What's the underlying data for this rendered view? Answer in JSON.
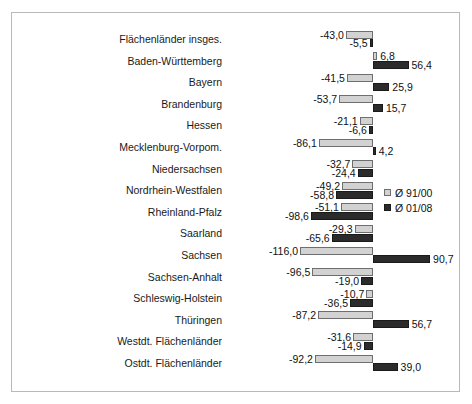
{
  "chart_data": {
    "type": "bar",
    "orientation": "horizontal",
    "title": "",
    "subtitle": "",
    "xlabel": "",
    "ylabel": "",
    "grid": false,
    "legend_position": "middle-right",
    "xlim": [
      -130,
      100
    ],
    "zero_axis": true,
    "categories": [
      "Flächenländer insges.",
      "Baden-Württemberg",
      "Bayern",
      "Brandenburg",
      "Hessen",
      "Mecklenburg-Vorpom.",
      "Niedersachsen",
      "Nordrhein-Westfalen",
      "Rheinland-Pfalz",
      "Saarland",
      "Sachsen",
      "Sachsen-Anhalt",
      "Schleswig-Holstein",
      "Thüringen",
      "Westdt. Flächenländer",
      "Ostdt. Flächenländer"
    ],
    "series": [
      {
        "name": "Ø 91/00",
        "color": "#d2d2d2",
        "values": [
          -43.0,
          6.8,
          -41.5,
          -53.7,
          -21.1,
          -86.1,
          -32.7,
          -49.2,
          -51.1,
          -29.3,
          -116.0,
          -96.5,
          -10.7,
          -87.2,
          -31.6,
          -92.2
        ],
        "labels": [
          "-43,0",
          "6,8",
          "-41,5",
          "-53,7",
          "-21,1",
          "-86,1",
          "-32,7",
          "-49,2",
          "-51,1",
          "-29,3",
          "-116,0",
          "-96,5",
          "-10,7",
          "-87,2",
          "-31,6",
          "-92,2"
        ]
      },
      {
        "name": "Ø 01/08",
        "color": "#2b2b2b",
        "values": [
          -5.5,
          56.4,
          25.9,
          15.7,
          -6.6,
          4.2,
          -24.4,
          -58.8,
          -98.6,
          -65.6,
          90.7,
          -19.0,
          -36.5,
          56.7,
          -14.9,
          39.0
        ],
        "labels": [
          "-5,5",
          "56,4",
          "25,9",
          "15,7",
          "-6,6",
          "4,2",
          "-24,4",
          "-58,8",
          "-98,6",
          "-65,6",
          "90,7",
          "-19,0",
          "-36,5",
          "56,7",
          "-14,9",
          "39,0"
        ]
      }
    ]
  },
  "legend": {
    "items": [
      {
        "label": "Ø 91/00"
      },
      {
        "label": "Ø 01/08"
      }
    ]
  }
}
